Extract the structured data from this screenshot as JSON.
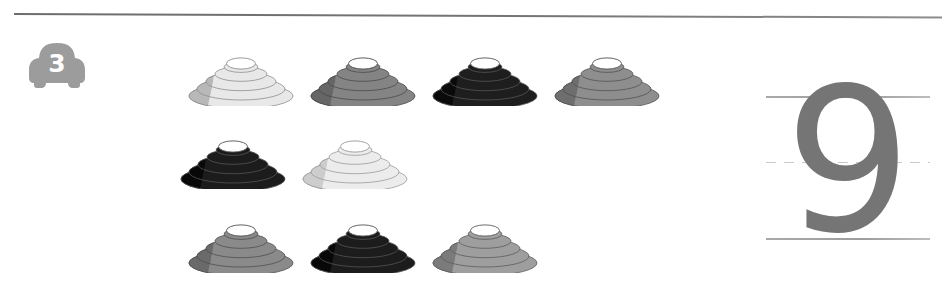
{
  "worksheet": {
    "exercise_badge": {
      "icon": "car-icon",
      "number": "3"
    },
    "top_rule": {
      "icon": "horizontal-rule"
    },
    "instruction_implied": "count-the-objects"
  },
  "objects": {
    "shape_name": "stacked-ring-cone",
    "total_count": 9,
    "rows": [
      {
        "row_index": 0,
        "items": [
          {
            "index": 1,
            "shade_name": "light",
            "fill": "#e8e8e8",
            "shadow": "#b8b8b8",
            "stroke": "#8e8e8e"
          },
          {
            "index": 2,
            "shade_name": "medium-gray",
            "fill": "#848484",
            "shadow": "#666666",
            "stroke": "#4a4a4a"
          },
          {
            "index": 3,
            "shade_name": "black",
            "fill": "#1e1e1e",
            "shadow": "#0a0a0a",
            "stroke": "#555555"
          },
          {
            "index": 4,
            "shade_name": "medium-gray",
            "fill": "#8e8e8e",
            "shadow": "#6e6e6e",
            "stroke": "#535353"
          }
        ]
      },
      {
        "row_index": 1,
        "items": [
          {
            "index": 5,
            "shade_name": "black",
            "fill": "#1c1c1c",
            "shadow": "#080808",
            "stroke": "#545454"
          },
          {
            "index": 6,
            "shade_name": "very-light",
            "fill": "#ececec",
            "shadow": "#cdcdcd",
            "stroke": "#9a9a9a"
          }
        ]
      },
      {
        "row_index": 2,
        "items": [
          {
            "index": 7,
            "shade_name": "medium-gray",
            "fill": "#8a8a8a",
            "shadow": "#6a6a6a",
            "stroke": "#4f4f4f"
          },
          {
            "index": 8,
            "shade_name": "black",
            "fill": "#1c1c1c",
            "shadow": "#080808",
            "stroke": "#545454"
          },
          {
            "index": 9,
            "shade_name": "light-medium",
            "fill": "#9e9e9e",
            "shadow": "#7b7b7b",
            "stroke": "#5d5d5d"
          }
        ]
      }
    ]
  },
  "answer_panel": {
    "glyph": "9",
    "glyph_color": "#757575",
    "guide_lines": {
      "top": "solid",
      "middle": "dashed",
      "bottom": "solid"
    }
  },
  "colors": {
    "page_background": "#ffffff",
    "rule": "#757575",
    "badge": "#9c9c9c",
    "badge_number": "#ffffff",
    "guide_line": "#a4a4a4",
    "guide_line_dashed": "#c9c9c9"
  }
}
